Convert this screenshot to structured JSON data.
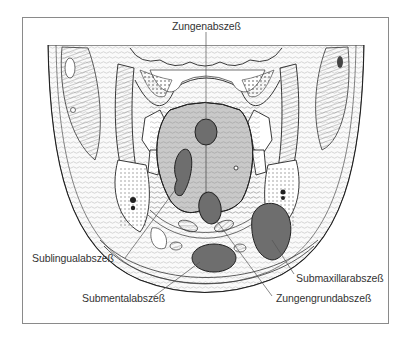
{
  "figure": {
    "type": "anatomical cross-section illustration",
    "labels": [
      {
        "id": "zungenabszess",
        "text": "Zungenabszeß",
        "x": 183,
        "y": 19
      },
      {
        "id": "sublingualabszess",
        "text": "Sublingualabszeß",
        "x": 34,
        "y": 255
      },
      {
        "id": "submentalabszess",
        "text": "Submentalabszeß",
        "x": 82,
        "y": 295
      },
      {
        "id": "zungengrundabszess",
        "text": "Zungengrundabszeß",
        "x": 276,
        "y": 295
      },
      {
        "id": "submaxillarabszess",
        "text": "Submaxillarabszeß",
        "x": 296,
        "y": 272
      }
    ],
    "colors": {
      "abscess_fill": "#6e6e6e",
      "tongue_fill": "#c9c9c9",
      "outline": "#2a2a2a",
      "frame": "#8a8a8a",
      "text": "#333333"
    }
  }
}
